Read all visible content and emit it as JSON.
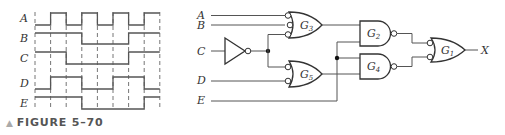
{
  "timing_diagram": {
    "signals": [
      {
        "name": "A",
        "levels": [
          0,
          1,
          0,
          1,
          0,
          1,
          0,
          1
        ]
      },
      {
        "name": "B",
        "levels": [
          1,
          1,
          1,
          0,
          0,
          0,
          1,
          1
        ]
      },
      {
        "name": "C",
        "levels": [
          1,
          1,
          0,
          0,
          0,
          0,
          1,
          1
        ]
      },
      {
        "name": "D",
        "levels": [
          0,
          1,
          1,
          0,
          0,
          1,
          1,
          0
        ]
      },
      {
        "name": "E",
        "levels": [
          1,
          1,
          1,
          0,
          0,
          0,
          0,
          1
        ]
      }
    ],
    "intervals": 8
  },
  "circuit": {
    "inputs": [
      "A",
      "B",
      "C",
      "D",
      "E"
    ],
    "output": "X",
    "gates": [
      {
        "id": "G",
        "sub": "3",
        "type": "OR with inverted inputs",
        "inputs": [
          "A",
          "B",
          "C'"
        ]
      },
      {
        "id": "G",
        "sub": "5",
        "type": "OR with inverted inputs",
        "inputs": [
          "C'",
          "D"
        ]
      },
      {
        "id": "G",
        "sub": "2",
        "type": "NAND",
        "inputs": [
          "G3",
          "E"
        ]
      },
      {
        "id": "G",
        "sub": "4",
        "type": "NAND",
        "inputs": [
          "E",
          "G5"
        ]
      },
      {
        "id": "G",
        "sub": "1",
        "type": "OR with inverted inputs",
        "inputs": [
          "G2",
          "G4"
        ]
      }
    ],
    "inverter": "C"
  },
  "labels": {
    "A": "A",
    "B": "B",
    "C": "C",
    "D": "D",
    "E": "E",
    "X": "X",
    "G": "G",
    "g1": "1",
    "g2": "2",
    "g3": "3",
    "g4": "4",
    "g5": "5"
  },
  "caption": {
    "marker": "▲",
    "text": "FIGURE 5–70"
  }
}
